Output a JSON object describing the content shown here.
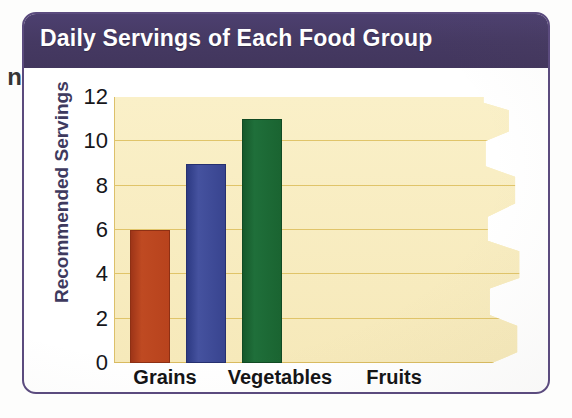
{
  "page": {
    "margin_text_fragment": "n"
  },
  "figure": {
    "title": "Daily Servings of Each Food Group",
    "frame_color": "#5b4b7e",
    "header_color": "#473a66",
    "plot_background": "#f8eec4",
    "gridline_color": "#e0c469"
  },
  "chart_data": {
    "type": "bar",
    "title": "Daily Servings of Each Food Group",
    "categories": [
      "Grains",
      "Vegetables",
      "Fruits"
    ],
    "values": [
      6,
      9,
      11
    ],
    "bar_colors": [
      "#b8431d",
      "#38448f",
      "#1a6431"
    ],
    "xlabel": "",
    "ylabel": "Recommended Servings",
    "ylim": [
      0,
      12
    ],
    "yticks": [
      0,
      2,
      4,
      6,
      8,
      10,
      12
    ],
    "ytick_labels": [
      "0",
      "2",
      "4",
      "6",
      "8",
      "10",
      "12"
    ],
    "grid": true,
    "legend": false,
    "note": "Bars are drawn left-aligned in the plot; category labels sit under the axis at Grains, Vegetables and Fruits positions."
  }
}
